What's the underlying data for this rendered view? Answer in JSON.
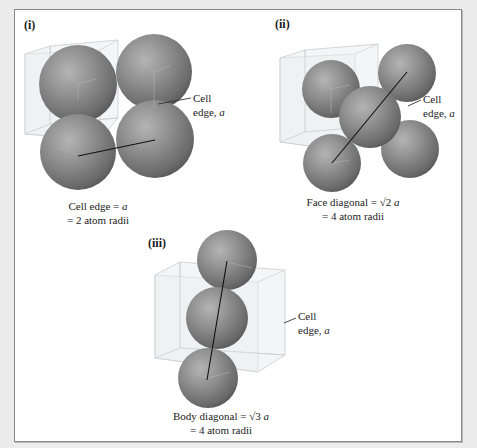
{
  "figure": {
    "background_color": "#ececec",
    "frame_color": "#ffffff",
    "sphere_colors": {
      "highlight": "#b0b0b0",
      "mid": "#8a8a8a",
      "shadow": "#5a5a5a"
    },
    "panels": [
      {
        "id": "i",
        "label": "(i)",
        "cell_label_line1": "Cell",
        "cell_label_line2_prefix": "edge, ",
        "cell_label_var": "a",
        "caption_line1_prefix": "Cell edge = ",
        "caption_line1_var": "a",
        "caption_line2": "= 2 atom radii",
        "lattice": "simple cubic"
      },
      {
        "id": "ii",
        "label": "(ii)",
        "cell_label_line1": "Cell",
        "cell_label_line2_prefix": "edge, ",
        "cell_label_var": "a",
        "caption_line1_prefix": "Face diagonal = ",
        "caption_line1_root": "√2",
        "caption_line1_var": "a",
        "caption_line2": "= 4 atom radii",
        "lattice": "face-centered cubic"
      },
      {
        "id": "iii",
        "label": "(iii)",
        "cell_label_line1": "Cell",
        "cell_label_line2_prefix": "edge, ",
        "cell_label_var": "a",
        "caption_line1_prefix": "Body diagonal = ",
        "caption_line1_root": "√3",
        "caption_line1_var": "a",
        "caption_line2": "= 4 atom radii",
        "lattice": "body-centered cubic"
      }
    ]
  }
}
